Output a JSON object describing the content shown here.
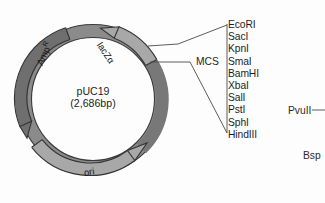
{
  "figure": {
    "type": "plasmid-map",
    "background_color": "#fdfdfd",
    "plasmid": {
      "name": "pUC19",
      "size": "(2,686bp)",
      "size_bp": 2686,
      "ring_color_dark": "#6f6f6f",
      "ring_color_light": "#a8a8a8",
      "ring_outline_color": "#2e2e2e",
      "features": [
        {
          "label": "lacZα",
          "name_plain": "lacZa",
          "direction": "counterclockwise",
          "shade": "light"
        },
        {
          "label": "Amp",
          "superscript": "R",
          "name_plain": "AmpR",
          "direction": "counterclockwise",
          "shade": "dark"
        },
        {
          "label": "ori",
          "name_plain": "ori",
          "direction": "clockwise",
          "shade": "light"
        }
      ]
    },
    "mcs": {
      "label": "MCS",
      "enzymes": [
        "EcoRI",
        "SacI",
        "KpnI",
        "SmaI",
        "BamHI",
        "XbaI",
        "SalI",
        "PstI",
        "SphI",
        "HindIII"
      ]
    },
    "outside_sites": [
      {
        "label": "PvuII",
        "has_leader": true
      },
      {
        "label": "Bsp",
        "has_leader": false,
        "truncated": true
      }
    ]
  }
}
